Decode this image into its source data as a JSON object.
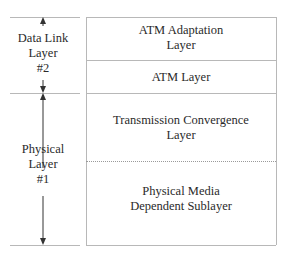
{
  "diagram": {
    "left_column": [
      {
        "line1": "Data Link",
        "line2": "Layer",
        "line3": "#2"
      },
      {
        "line1": "Physical",
        "line2": "Layer",
        "line3": "#1"
      }
    ],
    "right_column": [
      {
        "line1": "ATM Adaptation",
        "line2": "Layer"
      },
      {
        "line1": "ATM Layer"
      },
      {
        "line1": "Transmission Convergence",
        "line2": "Layer"
      },
      {
        "line1": "Physical Media",
        "line2": "Dependent Sublayer"
      }
    ],
    "colors": {
      "lines": "#b8b8b8",
      "arrows": "#333333",
      "text": "#2a2a2a"
    }
  }
}
